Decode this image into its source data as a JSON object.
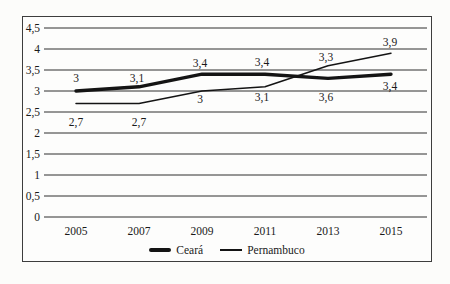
{
  "colors": {
    "line": "#141414",
    "grid": "#2e2e2e",
    "text": "#1a1a1a",
    "frame": "#3d3d3d",
    "background": "#fdfdfc"
  },
  "chart_data": {
    "type": "line",
    "categories": [
      "2005",
      "2007",
      "2009",
      "2011",
      "2013",
      "2015"
    ],
    "series": [
      {
        "name": "Ceará",
        "style": "thick",
        "values": [
          3,
          3.1,
          3.4,
          3.4,
          3.3,
          3.4
        ],
        "labels": [
          "3",
          "3,1",
          "3,4",
          "3,4",
          "3,3",
          "3,4"
        ]
      },
      {
        "name": "Pernambuco",
        "style": "thin",
        "values": [
          2.7,
          2.7,
          3,
          3.1,
          3.6,
          3.9
        ],
        "labels": [
          "2,7",
          "2,7",
          "3",
          "3,1",
          "3,6",
          "3,9"
        ]
      }
    ],
    "y_tick_labels": [
      "4,5",
      "4",
      "3,5",
      "3",
      "2,5",
      "2",
      "1,5",
      "1",
      "0,5",
      "0"
    ],
    "y_tick_values": [
      4.5,
      4,
      3.5,
      3,
      2.5,
      2,
      1.5,
      1,
      0.5,
      0
    ],
    "ylim": [
      0,
      4.5
    ],
    "grid": true,
    "legend_position": "bottom",
    "decimal_separator": ","
  }
}
